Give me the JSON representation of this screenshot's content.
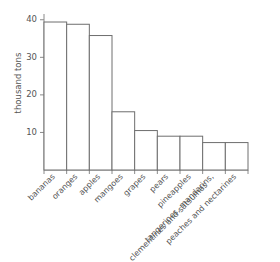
{
  "chart_data": {
    "type": "bar",
    "title": "",
    "xlabel": "",
    "ylabel": "thousand tons",
    "categories": [
      "bananas",
      "oranges",
      "apples",
      "mangoes",
      "grapes",
      "pears",
      "pineapples",
      "tangerines, mandarins, clementines and satsumas",
      "peaches and nectarines"
    ],
    "category_lines": [
      [
        "bananas"
      ],
      [
        "oranges"
      ],
      [
        "apples"
      ],
      [
        "mangoes"
      ],
      [
        "grapes"
      ],
      [
        "pears"
      ],
      [
        "pineapples"
      ],
      [
        "tangerines, mandarins,",
        "clementines and satsumas"
      ],
      [
        "peaches and nectarines"
      ]
    ],
    "values": [
      39.4,
      38.8,
      35.8,
      15.5,
      10.5,
      9.0,
      9.0,
      7.3,
      7.3
    ],
    "ylim": [
      0,
      41
    ],
    "yticks": [
      10,
      20,
      30,
      40
    ],
    "ytick_labels": [
      "10",
      "20",
      "30",
      "40"
    ],
    "grid": false,
    "legend": false,
    "bar_fill_color": "#ffffff",
    "bar_edge_color": "#6e6e6e",
    "axis_color": "#8a8a8a",
    "text_color": "#555555",
    "background_color": "#ffffff"
  }
}
